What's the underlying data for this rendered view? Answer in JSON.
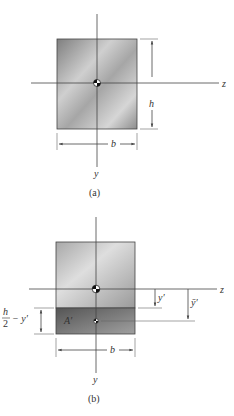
{
  "figure_a": {
    "caption": "(a)",
    "axis_z_label": "z",
    "axis_y_label": "y",
    "height_label": "h",
    "width_label": "b"
  },
  "figure_b": {
    "caption": "(b)",
    "axis_z_label": "z",
    "axis_y_label": "y",
    "width_label": "b",
    "area_label": "A′",
    "y_prime_label": "y′",
    "y_bar_prime_label": "ȳ′",
    "h_over_2_num": "h",
    "h_over_2_den": "2",
    "minus_y_prime": "− y′"
  },
  "colors": {
    "rect_light": "#d8d8d8",
    "rect_dark": "#8a8a8a",
    "area_dark": "#6e6e6e",
    "line": "#444444"
  }
}
